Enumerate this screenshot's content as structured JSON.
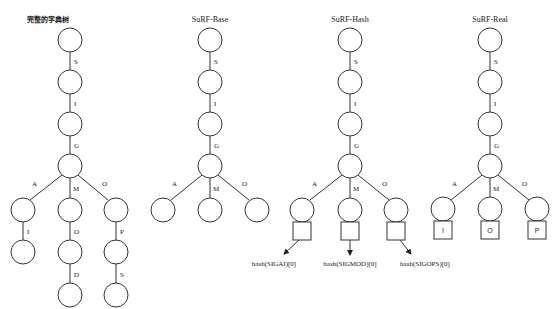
{
  "trees": [
    {
      "title": "完整的字典树",
      "spine_edges": [
        "S",
        "I",
        "G"
      ],
      "branches": [
        {
          "edge": "A",
          "children": [
            "I"
          ]
        },
        {
          "edge": "M",
          "children": [
            "O",
            "D"
          ]
        },
        {
          "edge": "O",
          "children": [
            "P",
            "S"
          ]
        }
      ]
    },
    {
      "title": "SuRF-Base",
      "spine_edges": [
        "S",
        "I",
        "G"
      ],
      "branches": [
        {
          "edge": "A"
        },
        {
          "edge": "M"
        },
        {
          "edge": "O"
        }
      ]
    },
    {
      "title": "SuRF-Hash",
      "spine_edges": [
        "S",
        "I",
        "G"
      ],
      "branches": [
        {
          "edge": "A",
          "hash": "hash(SIGAI)[0]"
        },
        {
          "edge": "M",
          "hash": "hash(SIGMOD)[0]"
        },
        {
          "edge": "O",
          "hash": "hash(SIGOPS)[0]"
        }
      ]
    },
    {
      "title": "SuRF-Real",
      "spine_edges": [
        "S",
        "I",
        "G"
      ],
      "branches": [
        {
          "edge": "A",
          "real": "I"
        },
        {
          "edge": "M",
          "real": "O"
        },
        {
          "edge": "O",
          "real": "P"
        }
      ]
    }
  ]
}
